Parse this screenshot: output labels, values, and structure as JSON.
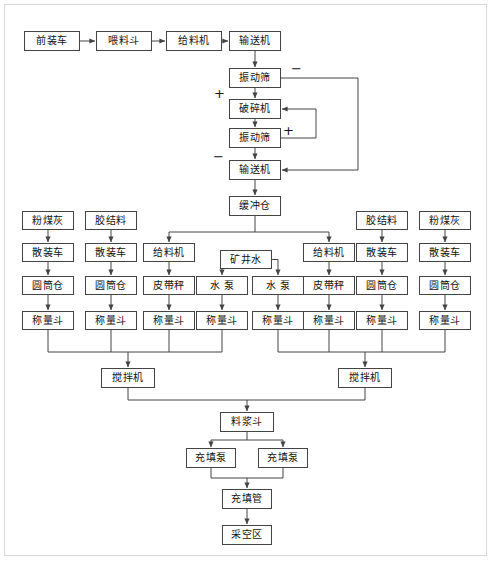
{
  "diagram": {
    "type": "process-flowchart",
    "line_color": "#444444",
    "box_fill": "#ffffff",
    "text_color": "#111111",
    "signs": [
      {
        "name": "minus-top",
        "label": "−",
        "x": 291,
        "y": 62
      },
      {
        "name": "plus-left",
        "label": "+",
        "x": 214,
        "y": 87
      },
      {
        "name": "plus-mid",
        "label": "+",
        "x": 283,
        "y": 124
      },
      {
        "name": "minus-left",
        "label": "−",
        "x": 213,
        "y": 150
      }
    ],
    "nodes": {
      "front_loader": "前装车",
      "feed_hopper": "喂料斗",
      "feeder_top": "给料机",
      "conveyor_top": "输送机",
      "vib_screen_1": "振动筛",
      "crusher": "破碎机",
      "vib_screen_2": "振动筛",
      "conveyor_2": "输送机",
      "buffer_silo": "缓冲仓",
      "fly_ash": "粉煤灰",
      "binder": "胶结料",
      "bulk_truck": "散装车",
      "cylinder_silo": "圆筒仓",
      "weigh_hopper": "称量斗",
      "feeder": "给料机",
      "belt_scale": "皮带秤",
      "mine_water": "矿井水",
      "water_pump": "水  泵",
      "mixer": "搅拌机",
      "slurry_hopper": "料浆斗",
      "fill_pump": "充填泵",
      "fill_pipe": "充填管",
      "goaf": "采空区"
    },
    "boxes": [
      {
        "name": "front-loader-box",
        "key": "front_loader",
        "x": 24,
        "y": 31,
        "w": 56,
        "h": 20
      },
      {
        "name": "feed-hopper-box",
        "key": "feed_hopper",
        "x": 96,
        "y": 31,
        "w": 56,
        "h": 20
      },
      {
        "name": "feeder-top-box",
        "key": "feeder_top",
        "x": 166,
        "y": 31,
        "w": 56,
        "h": 20
      },
      {
        "name": "conveyor-top-box",
        "key": "conveyor_top",
        "x": 229,
        "y": 31,
        "w": 52,
        "h": 20
      },
      {
        "name": "vibrating-screen-1-box",
        "key": "vib_screen_1",
        "x": 229,
        "y": 68,
        "w": 52,
        "h": 20
      },
      {
        "name": "crusher-box",
        "key": "crusher",
        "x": 229,
        "y": 99,
        "w": 52,
        "h": 20
      },
      {
        "name": "vibrating-screen-2-box",
        "key": "vib_screen_2",
        "x": 229,
        "y": 128,
        "w": 52,
        "h": 20
      },
      {
        "name": "conveyor-2-box",
        "key": "conveyor_2",
        "x": 229,
        "y": 160,
        "w": 52,
        "h": 20
      },
      {
        "name": "buffer-silo-box",
        "key": "buffer_silo",
        "x": 229,
        "y": 196,
        "w": 52,
        "h": 20
      },
      {
        "name": "fly-ash-left-box",
        "key": "fly_ash",
        "x": 22,
        "y": 211,
        "w": 52,
        "h": 19
      },
      {
        "name": "binder-left-box",
        "key": "binder",
        "x": 85,
        "y": 211,
        "w": 52,
        "h": 19
      },
      {
        "name": "binder-right-box",
        "key": "binder",
        "x": 356,
        "y": 211,
        "w": 52,
        "h": 19
      },
      {
        "name": "fly-ash-right-box",
        "key": "fly_ash",
        "x": 419,
        "y": 211,
        "w": 52,
        "h": 19
      },
      {
        "name": "bulk-truck-col1-box",
        "key": "bulk_truck",
        "x": 22,
        "y": 243,
        "w": 52,
        "h": 19
      },
      {
        "name": "bulk-truck-col2-box",
        "key": "bulk_truck",
        "x": 85,
        "y": 243,
        "w": 52,
        "h": 19
      },
      {
        "name": "feeder-col3-box",
        "key": "feeder",
        "x": 143,
        "y": 243,
        "w": 52,
        "h": 19
      },
      {
        "name": "mine-water-box",
        "key": "mine_water",
        "x": 220,
        "y": 250,
        "w": 52,
        "h": 19
      },
      {
        "name": "feeder-col6-box",
        "key": "feeder",
        "x": 303,
        "y": 243,
        "w": 52,
        "h": 19
      },
      {
        "name": "bulk-truck-col7-box",
        "key": "bulk_truck",
        "x": 356,
        "y": 243,
        "w": 52,
        "h": 19
      },
      {
        "name": "bulk-truck-col8-box",
        "key": "bulk_truck",
        "x": 419,
        "y": 243,
        "w": 52,
        "h": 19
      },
      {
        "name": "cylinder-silo-col1-box",
        "key": "cylinder_silo",
        "x": 22,
        "y": 276,
        "w": 52,
        "h": 19
      },
      {
        "name": "cylinder-silo-col2-box",
        "key": "cylinder_silo",
        "x": 85,
        "y": 276,
        "w": 52,
        "h": 19
      },
      {
        "name": "belt-scale-col3-box",
        "key": "belt_scale",
        "x": 143,
        "y": 276,
        "w": 52,
        "h": 19
      },
      {
        "name": "water-pump-col4-box",
        "key": "water_pump",
        "x": 196,
        "y": 276,
        "w": 52,
        "h": 19
      },
      {
        "name": "water-pump-col5-box",
        "key": "water_pump",
        "x": 252,
        "y": 276,
        "w": 52,
        "h": 19
      },
      {
        "name": "belt-scale-col6-box",
        "key": "belt_scale",
        "x": 303,
        "y": 276,
        "w": 52,
        "h": 19
      },
      {
        "name": "cylinder-silo-col7-box",
        "key": "cylinder_silo",
        "x": 356,
        "y": 276,
        "w": 52,
        "h": 19
      },
      {
        "name": "cylinder-silo-col8-box",
        "key": "cylinder_silo",
        "x": 419,
        "y": 276,
        "w": 52,
        "h": 19
      },
      {
        "name": "weigh-hopper-col1-box",
        "key": "weigh_hopper",
        "x": 22,
        "y": 311,
        "w": 52,
        "h": 19
      },
      {
        "name": "weigh-hopper-col2-box",
        "key": "weigh_hopper",
        "x": 85,
        "y": 311,
        "w": 52,
        "h": 19
      },
      {
        "name": "weigh-hopper-col3-box",
        "key": "weigh_hopper",
        "x": 143,
        "y": 311,
        "w": 52,
        "h": 19
      },
      {
        "name": "weigh-hopper-col4-box",
        "key": "weigh_hopper",
        "x": 196,
        "y": 311,
        "w": 52,
        "h": 19
      },
      {
        "name": "weigh-hopper-col5-box",
        "key": "weigh_hopper",
        "x": 252,
        "y": 311,
        "w": 52,
        "h": 19
      },
      {
        "name": "weigh-hopper-col6-box",
        "key": "weigh_hopper",
        "x": 303,
        "y": 311,
        "w": 52,
        "h": 19
      },
      {
        "name": "weigh-hopper-col7-box",
        "key": "weigh_hopper",
        "x": 356,
        "y": 311,
        "w": 52,
        "h": 19
      },
      {
        "name": "weigh-hopper-col8-box",
        "key": "weigh_hopper",
        "x": 419,
        "y": 311,
        "w": 52,
        "h": 19
      },
      {
        "name": "mixer-left-box",
        "key": "mixer",
        "x": 101,
        "y": 368,
        "w": 54,
        "h": 20
      },
      {
        "name": "mixer-right-box",
        "key": "mixer",
        "x": 338,
        "y": 368,
        "w": 54,
        "h": 20
      },
      {
        "name": "slurry-hopper-box",
        "key": "slurry_hopper",
        "x": 220,
        "y": 412,
        "w": 54,
        "h": 20
      },
      {
        "name": "fill-pump-left-box",
        "key": "fill_pump",
        "x": 186,
        "y": 448,
        "w": 50,
        "h": 20
      },
      {
        "name": "fill-pump-right-box",
        "key": "fill_pump",
        "x": 258,
        "y": 448,
        "w": 50,
        "h": 20
      },
      {
        "name": "fill-pipe-box",
        "key": "fill_pipe",
        "x": 222,
        "y": 489,
        "w": 50,
        "h": 20
      },
      {
        "name": "goaf-box",
        "key": "goaf",
        "x": 222,
        "y": 525,
        "w": 50,
        "h": 20
      }
    ]
  }
}
